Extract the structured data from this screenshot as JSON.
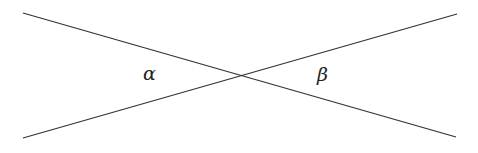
{
  "diagram": {
    "lines": [
      {
        "name": "line-1",
        "x1": 23,
        "y1": 13,
        "x2": 456,
        "y2": 137
      },
      {
        "name": "line-2",
        "x1": 23,
        "y1": 138,
        "x2": 457,
        "y2": 14
      }
    ],
    "intersection": {
      "x": 239,
      "y": 76
    },
    "labels": {
      "alpha": {
        "text": "α",
        "x": 143,
        "y": 80
      },
      "beta": {
        "text": "β",
        "x": 317,
        "y": 81
      }
    },
    "line_color": "#333333"
  }
}
